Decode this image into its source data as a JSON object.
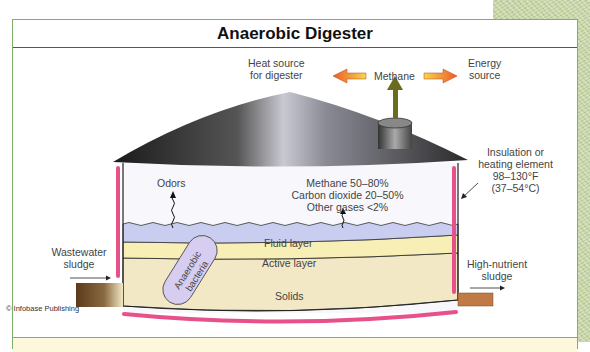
{
  "title": "Anaerobic Digester",
  "methane_flow": {
    "source": "Methane",
    "left_target_line1": "Heat source",
    "left_target_line2": "for digester",
    "right_target_line1": "Energy",
    "right_target_line2": "source"
  },
  "insulation": {
    "line1": "Insulation or",
    "line2": "heating element",
    "line3": "98–130°F",
    "line4": "(37–54°C)"
  },
  "gas_composition": {
    "line1": "Methane 50–80%",
    "line2": "Carbon dioxide 20–50%",
    "line3": "Other gases <2%"
  },
  "odors_label": "Odors",
  "layers": {
    "fluid": "Fluid layer",
    "active": "Active layer",
    "solids": "Solids"
  },
  "bacteria_label_line1": "Anaerobic",
  "bacteria_label_line2": "bacteria",
  "inlet": {
    "line1": "Wastewater",
    "line2": "sludge"
  },
  "outlet": {
    "line1": "High-nutrient",
    "line2": "sludge"
  },
  "credit": "© Infobase Publishing",
  "colors": {
    "border_green": "#7fae6a",
    "fluid_layer": "#c9cdf0",
    "active_layer": "#f7efb6",
    "solids_layer": "#f2e8c6",
    "heating_pink": "#e8508a",
    "outlet_brown": "#c07a45",
    "bacteria_purple": "#d6cdf0",
    "methane_arrow": "#6b6b1e",
    "flow_arrow_orange": "#f07a30"
  }
}
